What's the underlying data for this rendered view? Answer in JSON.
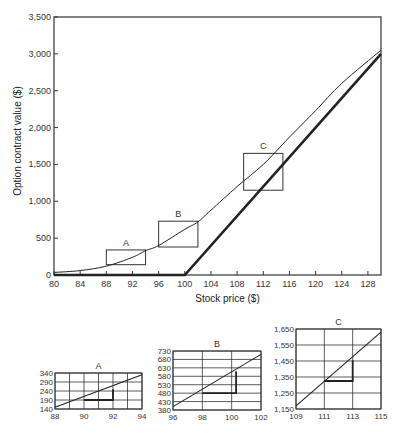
{
  "chart_data": [
    {
      "type": "line",
      "title": "",
      "xlabel": "Stock price ($)",
      "ylabel": "Option contract value ($)",
      "xlim": [
        80,
        130
      ],
      "ylim": [
        0,
        3500
      ],
      "x_ticks": [
        80,
        84,
        88,
        92,
        96,
        100,
        104,
        108,
        112,
        116,
        120,
        124,
        128
      ],
      "y_ticks": [
        0,
        500,
        1000,
        1500,
        2000,
        2500,
        3000,
        3500
      ],
      "y_tick_labels": [
        "0",
        "500",
        "1,000",
        "1,500",
        "2,000",
        "2,500",
        "3,000",
        "3,500"
      ],
      "grid": false,
      "series": [
        {
          "name": "Option contract value",
          "style": "thin",
          "x": [
            80,
            84,
            88,
            92,
            94,
            96,
            100,
            102,
            104,
            108,
            112,
            116,
            120,
            124,
            130
          ],
          "y": [
            35,
            60,
            120,
            240,
            330,
            400,
            620,
            720,
            880,
            1200,
            1500,
            1870,
            2230,
            2600,
            3050
          ]
        },
        {
          "name": "Intrinsic value",
          "style": "thick",
          "x": [
            80,
            100,
            130
          ],
          "y": [
            0,
            0,
            3000
          ]
        }
      ],
      "annotations": [
        {
          "label": "A",
          "x0": 88,
          "x1": 94,
          "y0": 140,
          "y1": 340
        },
        {
          "label": "B",
          "x0": 96,
          "x1": 102,
          "y0": 380,
          "y1": 730
        },
        {
          "label": "C",
          "x0": 109,
          "x1": 115,
          "y0": 1150,
          "y1": 1650
        }
      ]
    },
    {
      "type": "line",
      "title": "A",
      "xlim": [
        88,
        94
      ],
      "ylim": [
        140,
        340
      ],
      "x_ticks": [
        88,
        90,
        92,
        94
      ],
      "y_ticks": [
        140,
        190,
        240,
        290,
        340
      ],
      "x_grid": [
        88,
        89,
        90,
        91,
        92,
        93,
        94
      ],
      "grid": true,
      "series": [
        {
          "name": "Option contract value",
          "x": [
            88,
            94
          ],
          "y": [
            150,
            330
          ]
        }
      ],
      "slope_triangle": {
        "x0": 90,
        "x1": 92,
        "y0": 190,
        "y1": 250
      }
    },
    {
      "type": "line",
      "title": "B",
      "xlim": [
        96,
        102
      ],
      "ylim": [
        380,
        730
      ],
      "x_ticks": [
        96,
        98,
        100,
        102
      ],
      "y_ticks": [
        380,
        430,
        480,
        530,
        580,
        630,
        680,
        730
      ],
      "x_grid": [
        96,
        98,
        100,
        102
      ],
      "grid": true,
      "series": [
        {
          "name": "Option contract value",
          "x": [
            96,
            102
          ],
          "y": [
            400,
            710
          ]
        }
      ],
      "slope_triangle": {
        "x0": 98,
        "x1": 100.3,
        "y0": 480,
        "y1": 610
      }
    },
    {
      "type": "line",
      "title": "C",
      "xlim": [
        109,
        115
      ],
      "ylim": [
        1150,
        1650
      ],
      "x_ticks": [
        109,
        111,
        113,
        115
      ],
      "y_ticks": [
        1150,
        1250,
        1350,
        1450,
        1550,
        1650
      ],
      "y_tick_labels": [
        "1,150",
        "1,250",
        "1,350",
        "1,450",
        "1,550",
        "1,650"
      ],
      "x_grid": [
        109,
        111,
        113,
        115
      ],
      "grid": true,
      "series": [
        {
          "name": "Option contract value",
          "x": [
            109,
            115
          ],
          "y": [
            1170,
            1630
          ]
        }
      ],
      "slope_triangle": {
        "x0": 111,
        "x1": 113,
        "y0": 1325,
        "y1": 1455
      }
    }
  ],
  "layout": {
    "main": {
      "left": 54,
      "right": 381,
      "top": 17,
      "bottom": 275
    },
    "insets": [
      {
        "left": 55,
        "right": 142,
        "top": 373,
        "bottom": 409
      },
      {
        "left": 173,
        "right": 261,
        "top": 351,
        "bottom": 410
      },
      {
        "left": 296,
        "right": 381,
        "top": 329,
        "bottom": 409
      }
    ],
    "colors": {
      "line": "#222222",
      "grid": "#333333",
      "frame": "#333333"
    }
  }
}
